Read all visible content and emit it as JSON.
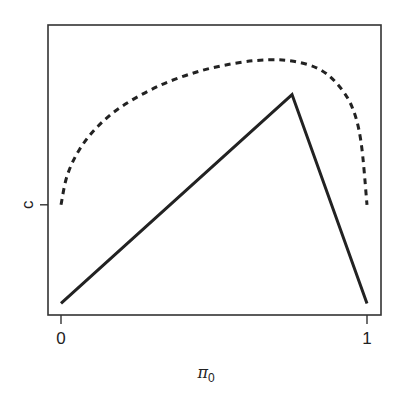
{
  "chart_data": {
    "type": "line",
    "title": "",
    "xlabel": "π0",
    "xlabel_symbol": "π",
    "xlabel_subscript": "0",
    "ylabel": "",
    "x_ticks": [
      {
        "value": 0,
        "label": "0"
      },
      {
        "value": 1,
        "label": "1"
      }
    ],
    "y_ticks": [
      {
        "value": 0.38,
        "label": "c"
      }
    ],
    "xlim": [
      -0.04,
      1.04
    ],
    "ylim": [
      0,
      1
    ],
    "grid": false,
    "legend": null,
    "series": [
      {
        "name": "solid",
        "style": "solid",
        "color": "#222222",
        "x": [
          0,
          0.755,
          1
        ],
        "y": [
          0.04,
          0.76,
          0.04
        ]
      },
      {
        "name": "dashed",
        "style": "dashed",
        "color": "#222222",
        "x": [
          0,
          0.02,
          0.06,
          0.12,
          0.2,
          0.32,
          0.45,
          0.58,
          0.68,
          0.76,
          0.84,
          0.9,
          0.95,
          0.98,
          1.0
        ],
        "y": [
          0.38,
          0.48,
          0.57,
          0.65,
          0.72,
          0.79,
          0.84,
          0.87,
          0.88,
          0.875,
          0.85,
          0.8,
          0.72,
          0.6,
          0.38
        ]
      }
    ]
  }
}
